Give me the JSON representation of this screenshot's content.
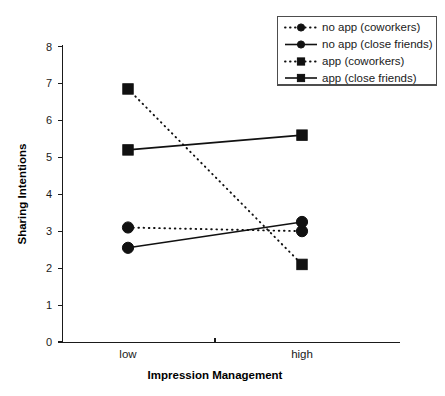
{
  "chart_data": {
    "type": "line",
    "title": "",
    "xlabel": "Impression Management",
    "ylabel": "Sharing Intentions",
    "categories": [
      "low",
      "high"
    ],
    "ylim": [
      0,
      8
    ],
    "yticks": [
      0,
      1,
      2,
      3,
      4,
      5,
      6,
      7,
      8
    ],
    "ytick_labels": [
      "0",
      "1",
      "2",
      "3",
      "4",
      "5",
      "6",
      "7",
      "8"
    ],
    "grid": false,
    "legend_position": "top-right",
    "series": [
      {
        "name": "no app (coworkers)",
        "values": [
          3.1,
          3.0
        ],
        "line_style": "dotted",
        "marker": "circle",
        "color": "#111111"
      },
      {
        "name": "no app (close friends)",
        "values": [
          2.55,
          3.25
        ],
        "line_style": "solid",
        "marker": "circle",
        "color": "#111111"
      },
      {
        "name": "app (coworkers)",
        "values": [
          6.85,
          2.1
        ],
        "line_style": "dotted",
        "marker": "square",
        "color": "#111111"
      },
      {
        "name": "app (close friends)",
        "values": [
          5.2,
          5.6
        ],
        "line_style": "solid",
        "marker": "square",
        "color": "#111111"
      }
    ]
  },
  "legend": {
    "entries": [
      "no app (coworkers)",
      "no app (close friends)",
      "app (coworkers)",
      "app (close friends)"
    ]
  },
  "axes": {
    "y_title": "Sharing Intentions",
    "x_title": "Impression Management",
    "y_ticks": [
      "0",
      "1",
      "2",
      "3",
      "4",
      "5",
      "6",
      "7",
      "8"
    ],
    "x_ticks": [
      "low",
      "high"
    ]
  },
  "colors": {
    "ink": "#111111",
    "axis": "#1a1a1a",
    "legend_border": "#4d4d4d",
    "background": "#ffffff"
  }
}
